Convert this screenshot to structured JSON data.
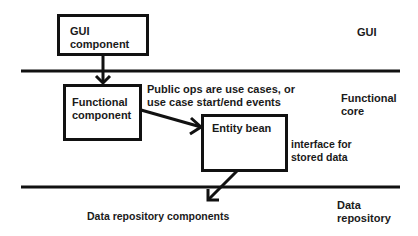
{
  "diagram": {
    "layers": [
      {
        "id": "gui",
        "label": "GUI"
      },
      {
        "id": "functional-core",
        "label": "Functional\ncore"
      },
      {
        "id": "data-repository",
        "label": "Data\nrepository"
      }
    ],
    "nodes": [
      {
        "id": "gui-component",
        "label": "GUI\ncomponent"
      },
      {
        "id": "functional-component",
        "label": "Functional\ncomponent"
      },
      {
        "id": "entity-bean",
        "label": "Entity bean"
      }
    ],
    "annotations": {
      "public_ops": "Public ops are use cases, or\nuse case start/end events",
      "interface": "interface for\nstored data",
      "data_repo_components": "Data repository components"
    },
    "edges": [
      {
        "from": "gui-component",
        "to": "functional-component"
      },
      {
        "from": "functional-component",
        "to": "entity-bean"
      },
      {
        "from": "entity-bean",
        "to": "data-repository-components"
      }
    ],
    "colors": {
      "line": "#111111",
      "background": "#ffffff",
      "text": "#1a1a1a"
    }
  }
}
